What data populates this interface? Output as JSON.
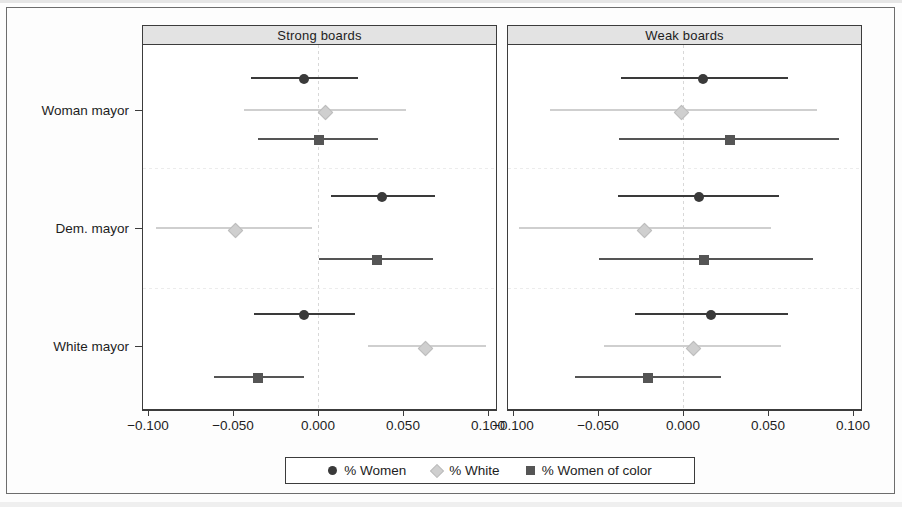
{
  "figure": {
    "panels": [
      {
        "key": "strong",
        "title": "Strong boards"
      },
      {
        "key": "weak",
        "title": "Weak boards"
      }
    ],
    "y_categories": [
      "Woman mayor",
      "Dem. mayor",
      "White mayor"
    ],
    "x_tick_labels": [
      "-0.100",
      "-0.050",
      "0.000",
      "0.050",
      "0.100"
    ]
  },
  "legend": {
    "items": [
      {
        "label": "% Women",
        "marker": "circle",
        "color": "#3a3a3a"
      },
      {
        "label": "% White",
        "marker": "diamond",
        "color": "#cfcfcf"
      },
      {
        "label": "% Women of color",
        "marker": "square",
        "color": "#555555"
      }
    ]
  },
  "colors": {
    "women": "#3a3a3a",
    "white": "#cfcfcf",
    "women_of_color": "#555555",
    "frame": "#3c3c3c",
    "strip_bg": "#e3e3e3",
    "zero_line": "#d8d8d8"
  },
  "chart_data": {
    "type": "scatter",
    "title": "",
    "subtitle": "",
    "xlabel": "",
    "ylabel": "",
    "xlim": [
      -0.125,
      0.125
    ],
    "xticks": [
      -0.1,
      -0.05,
      0.0,
      0.05,
      0.1
    ],
    "xtick_labels": [
      "-0.100",
      "-0.050",
      "0.000",
      "0.050",
      "0.100"
    ],
    "grid": false,
    "zero_reference_line": 0.0,
    "legend_position": "bottom",
    "facets": [
      "Strong boards",
      "Weak boards"
    ],
    "groups": [
      "Woman mayor",
      "Dem. mayor",
      "White mayor"
    ],
    "series": [
      {
        "name": "% Women",
        "marker": "circle",
        "color": "#3a3a3a"
      },
      {
        "name": "% White",
        "marker": "diamond",
        "color": "#cfcfcf"
      },
      {
        "name": "% Women of color",
        "marker": "square",
        "color": "#555555"
      }
    ],
    "points": [
      {
        "facet": "Strong boards",
        "group": "Woman mayor",
        "series": "% Women",
        "estimate": -0.009,
        "ci_low": -0.04,
        "ci_high": 0.023
      },
      {
        "facet": "Strong boards",
        "group": "Woman mayor",
        "series": "% White",
        "estimate": 0.003,
        "ci_low": -0.044,
        "ci_high": 0.051
      },
      {
        "facet": "Strong boards",
        "group": "Woman mayor",
        "series": "% Women of color",
        "estimate": 0.0,
        "ci_low": -0.036,
        "ci_high": 0.035
      },
      {
        "facet": "Strong boards",
        "group": "Dem. mayor",
        "series": "% Women",
        "estimate": 0.037,
        "ci_low": 0.007,
        "ci_high": 0.068
      },
      {
        "facet": "Strong boards",
        "group": "Dem. mayor",
        "series": "% White",
        "estimate": -0.05,
        "ci_low": -0.096,
        "ci_high": -0.004
      },
      {
        "facet": "Strong boards",
        "group": "Dem. mayor",
        "series": "% Women of color",
        "estimate": 0.034,
        "ci_low": 0.0,
        "ci_high": 0.067
      },
      {
        "facet": "Strong boards",
        "group": "White mayor",
        "series": "% Women",
        "estimate": -0.009,
        "ci_low": -0.038,
        "ci_high": 0.021
      },
      {
        "facet": "Strong boards",
        "group": "White mayor",
        "series": "% White",
        "estimate": 0.062,
        "ci_low": 0.029,
        "ci_high": 0.098
      },
      {
        "facet": "Strong boards",
        "group": "White mayor",
        "series": "% Women of color",
        "estimate": -0.036,
        "ci_low": -0.062,
        "ci_high": -0.009
      },
      {
        "facet": "Weak boards",
        "group": "Woman mayor",
        "series": "% Women",
        "estimate": 0.011,
        "ci_low": -0.037,
        "ci_high": 0.061
      },
      {
        "facet": "Weak boards",
        "group": "Woman mayor",
        "series": "% White",
        "estimate": -0.002,
        "ci_low": -0.079,
        "ci_high": 0.078
      },
      {
        "facet": "Weak boards",
        "group": "Woman mayor",
        "series": "% Women of color",
        "estimate": 0.027,
        "ci_low": -0.038,
        "ci_high": 0.091
      },
      {
        "facet": "Weak boards",
        "group": "Dem. mayor",
        "series": "% Women",
        "estimate": 0.009,
        "ci_low": -0.039,
        "ci_high": 0.056
      },
      {
        "facet": "Weak boards",
        "group": "Dem. mayor",
        "series": "% White",
        "estimate": -0.024,
        "ci_low": -0.097,
        "ci_high": 0.051
      },
      {
        "facet": "Weak boards",
        "group": "Dem. mayor",
        "series": "% Women of color",
        "estimate": 0.012,
        "ci_low": -0.05,
        "ci_high": 0.076
      },
      {
        "facet": "Weak boards",
        "group": "White mayor",
        "series": "% Women",
        "estimate": 0.016,
        "ci_low": -0.029,
        "ci_high": 0.061
      },
      {
        "facet": "Weak boards",
        "group": "White mayor",
        "series": "% White",
        "estimate": 0.005,
        "ci_low": -0.047,
        "ci_high": 0.057
      },
      {
        "facet": "Weak boards",
        "group": "White mayor",
        "series": "% Women of color",
        "estimate": -0.021,
        "ci_low": -0.064,
        "ci_high": 0.022
      }
    ]
  }
}
